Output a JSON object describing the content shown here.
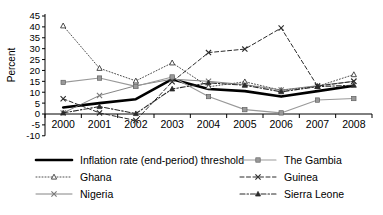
{
  "chart_data": {
    "type": "line",
    "title": "",
    "xlabel": "",
    "ylabel": "Percent",
    "categories": [
      "2000",
      "2001",
      "2002",
      "2003",
      "2004",
      "2005",
      "2006",
      "2007",
      "2008"
    ],
    "ylim": [
      -10,
      45
    ],
    "yticks": [
      45,
      40,
      35,
      30,
      25,
      20,
      15,
      10,
      5,
      0,
      -5,
      -10
    ],
    "ytick_labels": [
      "45",
      "40",
      "35",
      "30",
      "25",
      "20",
      "15",
      "10",
      "5",
      "0",
      "-5",
      "-10"
    ],
    "grid": false,
    "legend_position": "below",
    "series": [
      {
        "name": "Inflation rate (end-period) threshold",
        "color": "#000000",
        "style": "solid",
        "width": 2.6,
        "marker": "none",
        "values": [
          3,
          5,
          6.8,
          16,
          11.5,
          10.5,
          8,
          10.5,
          13
        ]
      },
      {
        "name": "Ghana",
        "color": "#3a3a3a",
        "style": "dotted",
        "width": 0.9,
        "marker": "triangle",
        "values": [
          40.5,
          21,
          15.2,
          23.5,
          12.5,
          14.8,
          10.9,
          12.7,
          18.1
        ]
      },
      {
        "name": "Nigeria",
        "color": "#777777",
        "style": "solid",
        "width": 0.9,
        "marker": "x",
        "values": [
          0.5,
          8.5,
          13,
          16,
          15,
          13.5,
          11,
          13,
          15
        ]
      },
      {
        "name": "The Gambia",
        "color": "#999999",
        "style": "solid",
        "width": 1.1,
        "marker": "square",
        "values": [
          14.5,
          16.5,
          12.7,
          17,
          8,
          2,
          0.5,
          6.4,
          7.1
        ]
      },
      {
        "name": "Guinea",
        "color": "#2b2b2b",
        "style": "dashed",
        "width": 1.0,
        "marker": "x",
        "values": [
          7,
          0.5,
          -3,
          14.8,
          28.2,
          29.8,
          39.5,
          12.8,
          15.0
        ]
      },
      {
        "name": "Sierra Leone",
        "color": "#2b2b2b",
        "style": "dashdot",
        "width": 1.1,
        "marker": "triangle-filled",
        "values": [
          0.5,
          3.4,
          0.2,
          11.5,
          14.3,
          13.2,
          10.2,
          12.6,
          13.2
        ]
      }
    ]
  },
  "legend": {
    "columns": [
      {
        "items": [
          {
            "label": "Inflation rate (end-period) threshold",
            "series": 0
          },
          {
            "label": "Ghana",
            "series": 1
          },
          {
            "label": "Nigeria",
            "series": 2
          }
        ]
      },
      {
        "items": [
          {
            "label": "The Gambia",
            "series": 3
          },
          {
            "label": "Guinea",
            "series": 4
          },
          {
            "label": "Sierra Leone",
            "series": 5
          }
        ]
      }
    ]
  }
}
